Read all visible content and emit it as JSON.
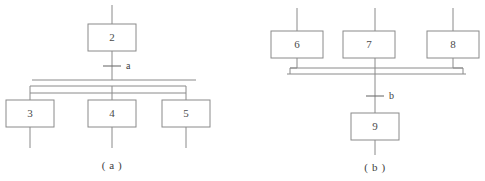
{
  "figure": {
    "width": 485,
    "height": 181,
    "background": "#ffffff",
    "line_color": "#8a8a8a",
    "text_color": "#4a4a4a"
  },
  "diagram_a": {
    "caption": "( a )",
    "boxes": [
      {
        "id": "box-2",
        "label": "2",
        "x": 88,
        "y": 24,
        "w": 48,
        "h": 27
      },
      {
        "id": "box-3",
        "label": "3",
        "x": 6,
        "y": 100,
        "w": 48,
        "h": 27
      },
      {
        "id": "box-4",
        "label": "4",
        "x": 88,
        "y": 100,
        "w": 48,
        "h": 27
      },
      {
        "id": "box-5",
        "label": "5",
        "x": 162,
        "y": 100,
        "w": 48,
        "h": 27
      }
    ],
    "transitions": [
      {
        "id": "transition-a",
        "label": "a",
        "x": 112,
        "y": 66
      }
    ],
    "bars": [
      {
        "id": "split-bar-upper",
        "x1": 32,
        "x2": 196,
        "y": 80
      },
      {
        "id": "split-bar-lower",
        "x1": 30,
        "x2": 186,
        "y": 86
      }
    ]
  },
  "diagram_b": {
    "caption": "( b )",
    "boxes": [
      {
        "id": "box-6",
        "label": "6",
        "x": 271,
        "y": 31,
        "w": 52,
        "h": 27
      },
      {
        "id": "box-7",
        "label": "7",
        "x": 343,
        "y": 31,
        "w": 52,
        "h": 27
      },
      {
        "id": "box-8",
        "label": "8",
        "x": 427,
        "y": 31,
        "w": 52,
        "h": 27
      },
      {
        "id": "box-9",
        "label": "9",
        "x": 347,
        "y": 113,
        "w": 48,
        "h": 27
      }
    ],
    "transitions": [
      {
        "id": "transition-b",
        "label": "b",
        "x": 375,
        "y": 96
      }
    ],
    "bars": [
      {
        "id": "join-bar-upper",
        "x1": 297,
        "x2": 461,
        "y": 68
      },
      {
        "id": "join-bar-lower",
        "x1": 290,
        "x2": 463,
        "y": 74
      }
    ]
  }
}
